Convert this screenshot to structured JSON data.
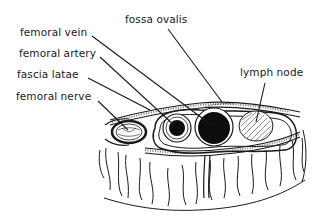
{
  "diagram": {
    "labels": {
      "femoral_vein": "femoral vein",
      "femoral_artery": "femoral artery",
      "fascia_latae": "fascia latae",
      "femoral_nerve": "femoral nerve",
      "fossa_ovalis": "fossa ovalis",
      "lymph_node": "lymph node"
    },
    "colors": {
      "ink": "#1a1a1a",
      "background": "#ffffff",
      "vessel_fill": "#0d0d0d"
    }
  }
}
